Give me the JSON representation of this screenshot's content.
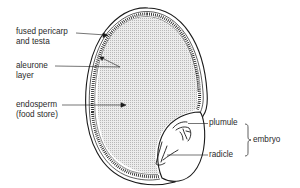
{
  "labels": {
    "pericarp": [
      "fused pericarp",
      "and testa"
    ],
    "aleurone": [
      "aleurone",
      "layer"
    ],
    "endosperm": [
      "endosperm",
      "(food store)"
    ],
    "plumule": "plumule",
    "radicle": "radicle",
    "embryo": "embryo"
  },
  "colors": {
    "outline": "#1a1a1a",
    "stipple": "#c8c8c8",
    "text": "#2a2a2a",
    "background": "#ffffff"
  }
}
